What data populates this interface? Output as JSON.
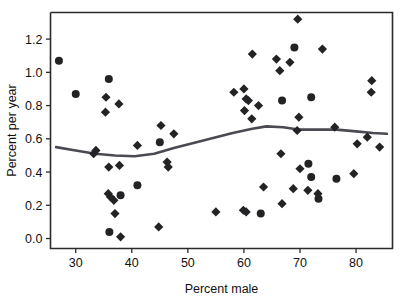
{
  "chart_data": {
    "type": "scatter",
    "title": "",
    "subtitle": "",
    "xlabel": "Percent male",
    "ylabel": "Percent per year",
    "xlim": [
      25.5,
      86.5
    ],
    "ylim": [
      -0.06,
      1.36
    ],
    "xticks": [
      30,
      40,
      50,
      60,
      70,
      80
    ],
    "xtick_labels": [
      "30",
      "40",
      "50",
      "60",
      "70",
      "80"
    ],
    "yticks": [
      0.0,
      0.2,
      0.4,
      0.6,
      0.8,
      1.0,
      1.2
    ],
    "ytick_labels": [
      "0.0",
      "0.2",
      "0.4",
      "0.6",
      "0.8",
      "1.0",
      "1.2"
    ],
    "grid": false,
    "legend": null,
    "legend_position": "none",
    "marker_color": "#232326",
    "line_color": "#4a4a52",
    "series": [
      {
        "name": "circle-markers",
        "marker": "circle",
        "points": [
          [
            27.0,
            1.07
          ],
          [
            30.0,
            0.87
          ],
          [
            35.9,
            0.96
          ],
          [
            38.0,
            0.26
          ],
          [
            36.0,
            0.04
          ],
          [
            41.0,
            0.32
          ],
          [
            45.0,
            0.58
          ],
          [
            63.0,
            0.15
          ],
          [
            66.8,
            0.83
          ],
          [
            69.0,
            1.15
          ],
          [
            72.0,
            0.85
          ],
          [
            71.5,
            0.45
          ],
          [
            72.0,
            0.37
          ],
          [
            73.3,
            0.24
          ],
          [
            76.5,
            0.36
          ]
        ]
      },
      {
        "name": "diamond-markers",
        "marker": "diamond",
        "points": [
          [
            33.2,
            0.51
          ],
          [
            33.6,
            0.53
          ],
          [
            35.4,
            0.85
          ],
          [
            35.3,
            0.76
          ],
          [
            37.7,
            0.81
          ],
          [
            35.9,
            0.43
          ],
          [
            37.8,
            0.44
          ],
          [
            35.8,
            0.27
          ],
          [
            36.2,
            0.25
          ],
          [
            36.8,
            0.23
          ],
          [
            37.0,
            0.15
          ],
          [
            38.0,
            0.01
          ],
          [
            41.0,
            0.56
          ],
          [
            45.2,
            0.68
          ],
          [
            47.5,
            0.63
          ],
          [
            46.3,
            0.46
          ],
          [
            46.5,
            0.43
          ],
          [
            44.8,
            0.07
          ],
          [
            55.0,
            0.16
          ],
          [
            58.2,
            0.88
          ],
          [
            60.0,
            0.9
          ],
          [
            60.4,
            0.84
          ],
          [
            60.8,
            0.83
          ],
          [
            60.1,
            0.77
          ],
          [
            61.4,
            0.72
          ],
          [
            61.5,
            1.11
          ],
          [
            62.6,
            0.8
          ],
          [
            59.9,
            0.17
          ],
          [
            60.4,
            0.16
          ],
          [
            63.5,
            0.31
          ],
          [
            65.8,
            1.08
          ],
          [
            66.4,
            1.01
          ],
          [
            66.8,
            0.21
          ],
          [
            66.6,
            0.51
          ],
          [
            68.2,
            1.06
          ],
          [
            68.8,
            0.3
          ],
          [
            69.6,
            1.32
          ],
          [
            69.8,
            0.73
          ],
          [
            69.5,
            0.65
          ],
          [
            70.0,
            0.42
          ],
          [
            71.4,
            0.29
          ],
          [
            73.2,
            0.27
          ],
          [
            74.0,
            1.14
          ],
          [
            76.2,
            0.67
          ],
          [
            79.6,
            0.39
          ],
          [
            80.2,
            0.57
          ],
          [
            82.0,
            0.61
          ],
          [
            82.8,
            0.95
          ],
          [
            82.7,
            0.88
          ],
          [
            84.2,
            0.55
          ]
        ]
      }
    ],
    "trend_line": {
      "name": "smoothed-trend",
      "points": [
        [
          26.5,
          0.55
        ],
        [
          30.0,
          0.53
        ],
        [
          33.5,
          0.51
        ],
        [
          37.0,
          0.5
        ],
        [
          40.5,
          0.495
        ],
        [
          44.0,
          0.51
        ],
        [
          47.5,
          0.545
        ],
        [
          51.0,
          0.575
        ],
        [
          54.5,
          0.605
        ],
        [
          58.0,
          0.635
        ],
        [
          61.5,
          0.66
        ],
        [
          64.0,
          0.675
        ],
        [
          67.0,
          0.67
        ],
        [
          70.0,
          0.655
        ],
        [
          73.0,
          0.655
        ],
        [
          76.5,
          0.655
        ],
        [
          80.0,
          0.645
        ],
        [
          83.0,
          0.635
        ],
        [
          85.5,
          0.63
        ]
      ]
    }
  },
  "axes": {
    "x_title": "Percent male",
    "y_title": "Percent per year"
  }
}
